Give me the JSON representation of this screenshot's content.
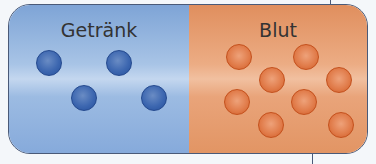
{
  "left_panel": {
    "label": "Getränk",
    "color": "#8eb0de",
    "particle_color": "#3d67b0",
    "particle_count": 4
  },
  "right_panel": {
    "label": "Blut",
    "color": "#e89a6c",
    "particle_color": "#e07a48",
    "particle_count": 8
  }
}
